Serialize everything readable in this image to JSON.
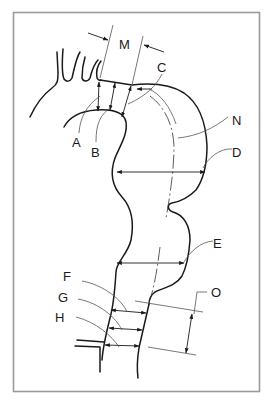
{
  "figure": {
    "labels": {
      "A": "A",
      "B": "B",
      "C": "C",
      "D": "D",
      "E": "E",
      "F": "F",
      "G": "G",
      "H": "H",
      "M": "M",
      "N": "N",
      "O": "O"
    },
    "colors": {
      "line": "#1a1a1a",
      "leader": "#555555",
      "frame": "#9a9a9a",
      "background": "#ffffff"
    }
  }
}
